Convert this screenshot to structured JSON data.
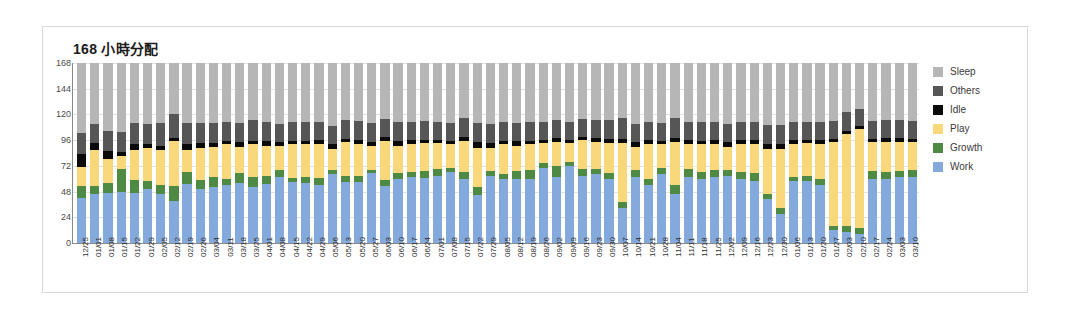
{
  "card": {
    "title": "168 小時分配"
  },
  "legend": {
    "position": "right",
    "items": [
      {
        "label": "Sleep",
        "color": "#b6b6b6"
      },
      {
        "label": "Others",
        "color": "#565656"
      },
      {
        "label": "Idle",
        "color": "#0a0a0a"
      },
      {
        "label": "Play",
        "color": "#f8d87a"
      },
      {
        "label": "Growth",
        "color": "#4f8a45"
      },
      {
        "label": "Work",
        "color": "#84a9dd"
      }
    ]
  },
  "chart_data": {
    "type": "bar",
    "stacked": true,
    "title": "168 小時分配",
    "xlabel": "",
    "ylabel": "",
    "ylim": [
      0,
      168
    ],
    "yticks": [
      0,
      24,
      48,
      72,
      96,
      120,
      144,
      168
    ],
    "grid": true,
    "legend_position": "right",
    "colors": {
      "Work": "#84a9dd",
      "Growth": "#4f8a45",
      "Play": "#f8d87a",
      "Idle": "#0a0a0a",
      "Others": "#565656",
      "Sleep": "#b6b6b6"
    },
    "categories": [
      "12/25",
      "01/01",
      "01/08",
      "01/15",
      "01/22",
      "01/29",
      "02/05",
      "02/12",
      "02/19",
      "02/26",
      "03/04",
      "03/11",
      "03/18",
      "03/25",
      "04/01",
      "04/08",
      "04/15",
      "04/22",
      "04/29",
      "05/06",
      "05/13",
      "05/20",
      "05/27",
      "06/03",
      "06/10",
      "06/17",
      "06/24",
      "07/01",
      "07/08",
      "07/15",
      "07/22",
      "07/29",
      "08/05",
      "08/12",
      "08/19",
      "08/26",
      "09/02",
      "09/09",
      "09/16",
      "09/23",
      "09/30",
      "10/07",
      "10/14",
      "10/21",
      "10/28",
      "11/04",
      "11/11",
      "11/18",
      "11/25",
      "12/02",
      "12/09",
      "12/16",
      "12/23",
      "12/30",
      "01/06",
      "01/13",
      "01/20",
      "01/27",
      "02/03",
      "02/10",
      "02/17",
      "02/24",
      "03/03",
      "03/10"
    ],
    "series": [
      {
        "name": "Work",
        "values": [
          42,
          46,
          47,
          48,
          47,
          50,
          46,
          39,
          55,
          50,
          52,
          54,
          56,
          52,
          55,
          62,
          57,
          56,
          54,
          64,
          57,
          57,
          65,
          53,
          60,
          62,
          61,
          63,
          66,
          60,
          45,
          63,
          60,
          60,
          60,
          70,
          62,
          72,
          63,
          64,
          60,
          33,
          62,
          54,
          64,
          46,
          62,
          60,
          62,
          63,
          60,
          58,
          41,
          27,
          58,
          58,
          54,
          12,
          10,
          8,
          60,
          60,
          62,
          62
        ]
      },
      {
        "name": "Growth",
        "values": [
          11,
          7,
          9,
          21,
          12,
          8,
          8,
          14,
          11,
          9,
          10,
          6,
          9,
          10,
          8,
          6,
          4,
          6,
          7,
          4,
          6,
          6,
          3,
          6,
          5,
          4,
          6,
          6,
          4,
          6,
          7,
          4,
          4,
          7,
          8,
          5,
          10,
          4,
          6,
          5,
          5,
          5,
          6,
          6,
          6,
          8,
          7,
          6,
          6,
          5,
          6,
          7,
          5,
          6,
          4,
          5,
          6,
          4,
          6,
          6,
          7,
          6,
          5,
          6
        ]
      },
      {
        "name": "Play",
        "values": [
          18,
          34,
          22,
          12,
          28,
          31,
          33,
          42,
          21,
          30,
          28,
          32,
          25,
          30,
          28,
          23,
          31,
          30,
          31,
          20,
          31,
          29,
          23,
          36,
          26,
          26,
          26,
          24,
          22,
          29,
          37,
          22,
          28,
          24,
          24,
          18,
          22,
          17,
          27,
          25,
          28,
          55,
          22,
          32,
          22,
          40,
          23,
          26,
          24,
          22,
          26,
          27,
          42,
          55,
          30,
          30,
          32,
          78,
          86,
          92,
          27,
          28,
          27,
          26
        ]
      },
      {
        "name": "Idle",
        "values": [
          12,
          6,
          8,
          4,
          5,
          3,
          4,
          3,
          5,
          4,
          3,
          3,
          4,
          3,
          4,
          3,
          3,
          3,
          4,
          4,
          3,
          4,
          3,
          4,
          4,
          4,
          3,
          3,
          3,
          4,
          5,
          4,
          3,
          4,
          3,
          3,
          4,
          3,
          3,
          4,
          4,
          4,
          4,
          4,
          3,
          4,
          4,
          3,
          4,
          4,
          4,
          4,
          4,
          4,
          4,
          3,
          4,
          3,
          3,
          3,
          3,
          4,
          4,
          3
        ]
      },
      {
        "name": "Others",
        "values": [
          20,
          18,
          19,
          19,
          20,
          19,
          21,
          22,
          20,
          19,
          19,
          18,
          18,
          20,
          18,
          17,
          18,
          18,
          17,
          17,
          18,
          18,
          18,
          17,
          18,
          17,
          18,
          17,
          17,
          18,
          18,
          18,
          18,
          17,
          18,
          17,
          17,
          17,
          17,
          17,
          18,
          20,
          17,
          17,
          17,
          19,
          17,
          18,
          17,
          17,
          17,
          17,
          18,
          18,
          17,
          17,
          17,
          17,
          17,
          16,
          17,
          17,
          17,
          17
        ]
      },
      {
        "name": "Sleep",
        "values": [
          65,
          57,
          63,
          64,
          56,
          57,
          56,
          48,
          56,
          56,
          56,
          55,
          56,
          53,
          55,
          57,
          55,
          55,
          55,
          59,
          53,
          54,
          56,
          52,
          55,
          55,
          54,
          55,
          56,
          51,
          56,
          57,
          55,
          56,
          55,
          55,
          53,
          55,
          52,
          53,
          53,
          51,
          57,
          55,
          56,
          51,
          55,
          55,
          55,
          57,
          55,
          55,
          58,
          58,
          55,
          55,
          55,
          54,
          46,
          43,
          54,
          53,
          53,
          54
        ]
      }
    ]
  }
}
